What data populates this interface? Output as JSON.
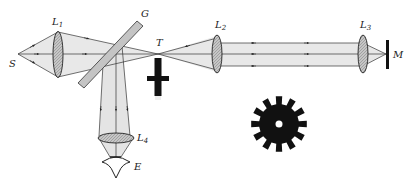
{
  "labels": {
    "source": "S",
    "lens1": "L",
    "lens1_sub": "1",
    "glass_plate": "G",
    "focal_point": "T",
    "lens2": "L",
    "lens2_sub": "2",
    "lens3": "L",
    "lens3_sub": "3",
    "mirror": "M",
    "lens4": "L",
    "lens4_sub": "4",
    "eye": "E"
  },
  "colors": {
    "beam_fill": "#e6e6e6",
    "lens_fill": "#b8b8b8",
    "line": "#333333",
    "solid": "#111111",
    "plate_fill": "#c4c4c4"
  },
  "wheel": {
    "teeth": 12,
    "cx": 279,
    "cy": 124
  }
}
